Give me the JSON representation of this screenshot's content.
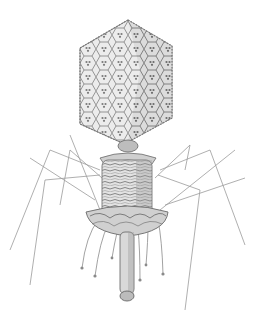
{
  "image": {
    "subject": "bacteriophage illustration",
    "colors": {
      "background": "#ffffff",
      "ink_dark": "#5a5a5a",
      "ink_mid": "#8c8c8c",
      "ink_light": "#c8c8c8",
      "fill_light": "#e9e9e9",
      "fill_mid": "#d4d4d4"
    }
  }
}
